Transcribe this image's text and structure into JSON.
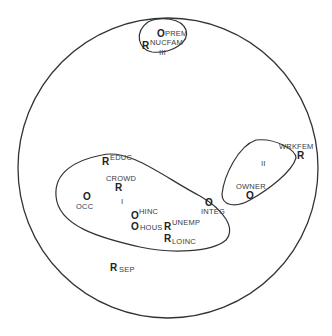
{
  "diagram": {
    "type": "smallest-space-analysis",
    "regions": [
      {
        "id": "I",
        "label": "I"
      },
      {
        "id": "II",
        "label": "II"
      },
      {
        "id": "III",
        "label": "III"
      }
    ],
    "points": [
      {
        "symbol": "O",
        "label": "PREM",
        "region": "III"
      },
      {
        "symbol": "R",
        "label": "NUCFAM",
        "region": "III"
      },
      {
        "symbol": "R",
        "label": "EDUC",
        "region": "I"
      },
      {
        "symbol": "R",
        "label": "CROWD",
        "region": "I"
      },
      {
        "symbol": "O",
        "label": "OCC",
        "region": "I"
      },
      {
        "symbol": "O",
        "label": "HINC",
        "region": "I"
      },
      {
        "symbol": "O",
        "label": "HOUS",
        "region": "I"
      },
      {
        "symbol": "R",
        "label": "UNEMP",
        "region": "I"
      },
      {
        "symbol": "R",
        "label": "LOINC",
        "region": "I"
      },
      {
        "symbol": "O",
        "label": "INTEG",
        "region": "none"
      },
      {
        "symbol": "R",
        "label": "WRKFEM",
        "region": "II"
      },
      {
        "symbol": "O",
        "label": "OWNER",
        "region": "II"
      },
      {
        "symbol": "R",
        "label": "SEP",
        "region": "none"
      }
    ]
  }
}
